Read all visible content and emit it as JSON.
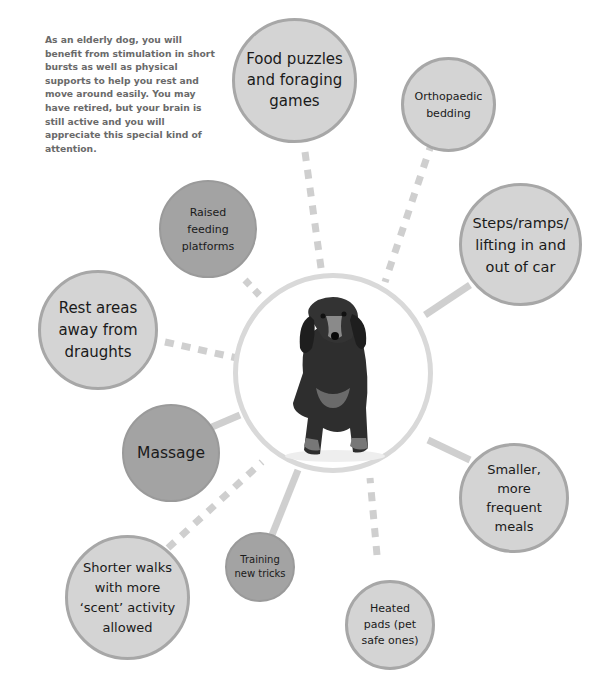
{
  "intro_text": "As an elderly dog, you will benefit from stimulation in short bursts as well as physical supports to help you rest and move around easily. You may have retired, but your brain is still active and you will appreciate this special kind of attention.",
  "center": {
    "image": "elderly-dachshund-photo"
  },
  "nodes": [
    {
      "id": "food-puzzles",
      "label": "Food puzzles and foraging games",
      "connector": "dashed"
    },
    {
      "id": "orthopaedic-bedding",
      "label": "Orthopaedic bedding",
      "connector": "dashed"
    },
    {
      "id": "raised-feeding",
      "label": "Raised feeding platforms",
      "connector": "dashed"
    },
    {
      "id": "steps-ramps",
      "label": "Steps/ramps/ lifting in and out of car",
      "connector": "solid"
    },
    {
      "id": "rest-areas",
      "label": "Rest areas away from draughts",
      "connector": "dashed"
    },
    {
      "id": "massage",
      "label": "Massage",
      "connector": "solid"
    },
    {
      "id": "smaller-meals",
      "label": "Smaller, more frequent meals",
      "connector": "solid"
    },
    {
      "id": "shorter-walks",
      "label": "Shorter walks with more ‘scent’ activity allowed",
      "connector": "dashed"
    },
    {
      "id": "training",
      "label": "Training new tricks",
      "connector": "solid"
    },
    {
      "id": "heated-pads",
      "label": "Heated pads (pet safe ones)",
      "connector": "dashed"
    }
  ],
  "colors": {
    "light_node_fill": "#d4d4d4",
    "light_node_border": "#a7a7a7",
    "dark_node_fill": "#a3a3a3",
    "connector": "#cfcfcf",
    "center_ring": "#d9d9d9",
    "intro_text": "#6a6a6a"
  }
}
